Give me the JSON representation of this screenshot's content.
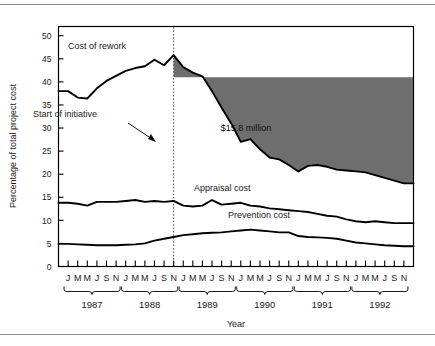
{
  "figure": {
    "background": "#ffffff",
    "frame_color": "#000000",
    "shaded_color": "#6e6e6e",
    "rule_color": "#8b8b8b"
  },
  "annotations": {
    "cost_of_rework": "Cost of rework",
    "start_of_initiative": "Start of initiative",
    "savings": "$15.8 million",
    "appraisal_cost": "Appraisal cost",
    "prevention_cost": "Prevention cost"
  },
  "chart_data": {
    "type": "line",
    "title": "",
    "xlabel": "Year",
    "ylabel": "Percentage of total project cost",
    "ylim": [
      0,
      52
    ],
    "yticks": [
      0,
      5,
      10,
      15,
      20,
      25,
      30,
      35,
      40,
      45,
      50
    ],
    "ytick_labels": [
      "0",
      "5",
      "10",
      "15",
      "20",
      "25",
      "30",
      "35",
      "40",
      "45",
      "50"
    ],
    "grid": false,
    "legend": "inline-annotations",
    "months_per_year": [
      "J",
      "M",
      "M",
      "J",
      "S",
      "N"
    ],
    "years": [
      "1987",
      "1988",
      "1989",
      "1990",
      "1991",
      "1992"
    ],
    "x": [
      "1987-J",
      "1987-M",
      "1987-M",
      "1987-J",
      "1987-S",
      "1987-N",
      "1988-J",
      "1988-M",
      "1988-M",
      "1988-J",
      "1988-S",
      "1988-N",
      "1989-J",
      "1989-M",
      "1989-M",
      "1989-J",
      "1989-S",
      "1989-N",
      "1990-J",
      "1990-M",
      "1990-M",
      "1990-J",
      "1990-S",
      "1990-N",
      "1991-J",
      "1991-M",
      "1991-M",
      "1991-J",
      "1991-S",
      "1991-N",
      "1992-J",
      "1992-M",
      "1992-M",
      "1992-J",
      "1992-S",
      "1992-N"
    ],
    "series": [
      {
        "name": "Cost of rework",
        "color": "#000000",
        "values": [
          38.0,
          36.6,
          36.4,
          38.6,
          40.2,
          41.3,
          42.4,
          43.0,
          43.4,
          44.8,
          43.6,
          45.8,
          43.2,
          42.0,
          41.2,
          38.0,
          34.4,
          31.0,
          27.0,
          27.6,
          25.4,
          23.6,
          23.2,
          22.0,
          20.6,
          21.8,
          22.0,
          21.6,
          21.0,
          20.8,
          20.6,
          20.4,
          19.8,
          19.2,
          18.6,
          18.0
        ]
      },
      {
        "name": "Appraisal cost",
        "color": "#000000",
        "values": [
          13.8,
          13.6,
          13.2,
          14.0,
          14.0,
          14.0,
          14.2,
          14.4,
          14.0,
          14.2,
          14.0,
          14.2,
          13.2,
          13.0,
          13.2,
          14.4,
          13.4,
          13.6,
          13.8,
          13.2,
          13.0,
          12.6,
          12.4,
          12.2,
          12.0,
          11.8,
          11.4,
          11.0,
          10.8,
          10.2,
          9.8,
          9.6,
          9.8,
          9.6,
          9.4,
          9.4
        ]
      },
      {
        "name": "Prevention cost",
        "color": "#000000",
        "values": [
          4.9,
          4.8,
          4.7,
          4.6,
          4.6,
          4.6,
          4.7,
          4.8,
          5.0,
          5.6,
          6.0,
          6.4,
          6.8,
          7.0,
          7.2,
          7.3,
          7.4,
          7.6,
          7.8,
          8.0,
          7.8,
          7.6,
          7.4,
          7.4,
          6.6,
          6.4,
          6.3,
          6.2,
          6.0,
          5.6,
          5.2,
          5.0,
          4.8,
          4.6,
          4.5,
          4.4
        ]
      }
    ],
    "initiative_marker": {
      "label": "Start of initiative",
      "x_index": 11,
      "style": "dotted-vertical"
    },
    "shaded_region": {
      "label": "$15.8 million",
      "description": "Savings area between pre-initiative rework level and actual rework cost",
      "baseline_value": 41.0,
      "start_x_index": 11,
      "end_x_index": 35,
      "color": "#6e6e6e"
    }
  }
}
